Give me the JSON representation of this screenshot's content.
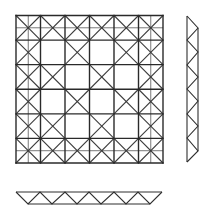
{
  "canvas": {
    "width": 211,
    "height": 220,
    "background": "#ffffff"
  },
  "colors": {
    "primary_line": "#2a2a2a",
    "secondary_line": "#6a6a6a",
    "diagonal": "#3a3a3a"
  },
  "plan_grid": {
    "x0": 16,
    "y0": 15.5,
    "x1": 163,
    "y1": 163,
    "cells": 6,
    "half_lines": true,
    "outer_ring_all_crossed": true,
    "inner_checker_parity": "odd"
  },
  "side_elevation": {
    "outer_x": 187,
    "inner_x": 198,
    "outer_y0": 16,
    "outer_y1": 162,
    "inner_y0": 28,
    "inner_y1": 151,
    "outer_vertices_y": [
      16,
      40,
      65,
      89,
      114,
      138,
      162
    ],
    "inner_vertices_y": [
      28,
      52,
      77,
      101,
      126,
      151
    ]
  },
  "bottom_elevation": {
    "outer_y": 192,
    "inner_y": 204,
    "outer_x0": 16,
    "outer_x1": 162,
    "inner_x0": 28,
    "inner_x1": 150,
    "outer_vertices_x": [
      16,
      40,
      65,
      89,
      114,
      138,
      162
    ],
    "inner_vertices_x": [
      28,
      52,
      77,
      101,
      126,
      150
    ]
  }
}
